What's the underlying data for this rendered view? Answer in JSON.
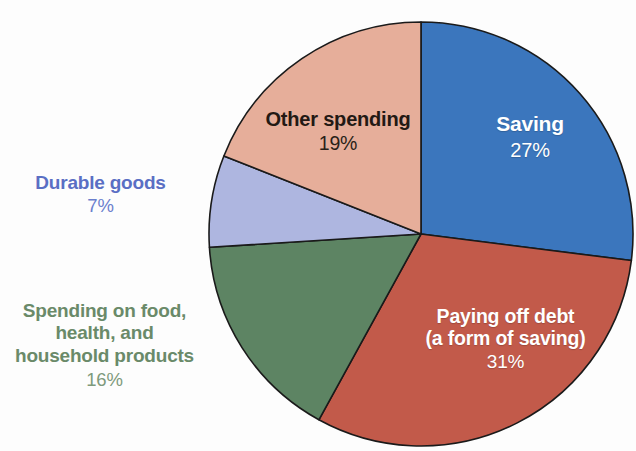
{
  "chart_data": {
    "type": "pie",
    "title": "",
    "subtitle": "",
    "xlabel": "",
    "ylabel": "",
    "legend_position": "none",
    "grid": false,
    "units": "percent",
    "start_angle_deg": 0,
    "direction": "clockwise",
    "categories": [
      "Saving",
      "Paying off debt (a form of saving)",
      "Spending on food, health, and household products",
      "Durable goods",
      "Other spending"
    ],
    "values": [
      27,
      31,
      16,
      7,
      19
    ],
    "colors": [
      "#3b76bd",
      "#c25a4a",
      "#5d8463",
      "#aeb6e0",
      "#e6ae9a"
    ],
    "slices": [
      {
        "id": "saving",
        "label": "Saving",
        "value": 27,
        "value_text": "27%",
        "color": "#3b76bd",
        "label_color": "#ffffff",
        "label_placement": "inside"
      },
      {
        "id": "paying-off-debt",
        "label_line1": "Paying off debt",
        "label_line2": "(a form of saving)",
        "label": "Paying off debt (a form of saving)",
        "value": 31,
        "value_text": "31%",
        "color": "#c25a4a",
        "label_color": "#ffffff",
        "label_placement": "inside"
      },
      {
        "id": "spending-food-health-household",
        "label_line1": "Spending on food,",
        "label_line2": "health, and",
        "label_line3": "household products",
        "label": "Spending on food, health, and household products",
        "value": 16,
        "value_text": "16%",
        "color": "#5d8463",
        "label_color": "#6a8a69",
        "label_placement": "outside-left"
      },
      {
        "id": "durable-goods",
        "label": "Durable goods",
        "value": 7,
        "value_text": "7%",
        "color": "#aeb6e0",
        "label_color": "#5a6fc4",
        "label_placement": "outside-left"
      },
      {
        "id": "other-spending",
        "label": "Other spending",
        "value": 19,
        "value_text": "19%",
        "color": "#e6ae9a",
        "label_color": "#231914",
        "label_placement": "inside"
      }
    ]
  },
  "labels": {
    "saving": {
      "name": "Saving",
      "percent": "27%"
    },
    "debt": {
      "line1": "Paying off debt",
      "line2": "(a form of saving)",
      "percent": "31%"
    },
    "other": {
      "name": "Other spending",
      "percent": "19%"
    },
    "durable": {
      "name": "Durable goods",
      "percent": "7%"
    },
    "food": {
      "line1": "Spending on food,",
      "line2": "health, and",
      "line3": "household products",
      "percent": "16%"
    }
  }
}
